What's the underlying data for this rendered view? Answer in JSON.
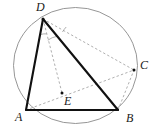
{
  "figure": {
    "canvas": {
      "width": 153,
      "height": 130,
      "background": "#ffffff"
    },
    "colors": {
      "circle_stroke": "#8a8a8a",
      "solid_stroke": "#111111",
      "dashed_stroke": "#9a9a9a",
      "label_fill": "#1a1a1a",
      "point_fill": "#111111"
    },
    "circle": {
      "name": "circumscribed-circle",
      "cx": 75.5,
      "cy": 65.5,
      "rx": 62,
      "ry": 58,
      "stroke_width": 0.9
    },
    "points": [
      {
        "id": "A",
        "label": "A",
        "x": 26,
        "y": 110,
        "label_x": 15,
        "label_y": 121,
        "dot": false
      },
      {
        "id": "B",
        "label": "B",
        "x": 118,
        "y": 110,
        "label_x": 126,
        "label_y": 122,
        "dot": false
      },
      {
        "id": "C",
        "label": "C",
        "x": 134,
        "y": 70,
        "label_x": 140,
        "label_y": 69,
        "dot": true
      },
      {
        "id": "D",
        "label": "D",
        "x": 43,
        "y": 19,
        "label_x": 36,
        "label_y": 11,
        "dot": true
      },
      {
        "id": "E",
        "label": "E",
        "x": 62,
        "y": 93,
        "label_x": 64,
        "label_y": 105,
        "dot": true
      }
    ],
    "solid_segments": [
      {
        "id": "AD",
        "name": "segment-a-d",
        "x1": 26,
        "y1": 110,
        "x2": 43,
        "y2": 19,
        "width": 2.1
      },
      {
        "id": "DB",
        "name": "segment-d-b",
        "x1": 43,
        "y1": 19,
        "x2": 118,
        "y2": 110,
        "width": 2.1
      },
      {
        "id": "AB",
        "name": "segment-a-b",
        "x1": 26,
        "y1": 110,
        "x2": 118,
        "y2": 110,
        "width": 2.1
      }
    ],
    "dashed_segments": [
      {
        "id": "DC",
        "name": "segment-d-c",
        "x1": 43,
        "y1": 19,
        "x2": 134,
        "y2": 70,
        "width": 0.8
      },
      {
        "id": "DE",
        "name": "segment-d-e",
        "x1": 43,
        "y1": 19,
        "x2": 62,
        "y2": 93,
        "width": 0.8
      },
      {
        "id": "AC",
        "name": "segment-a-c",
        "x1": 26,
        "y1": 110,
        "x2": 134,
        "y2": 70,
        "width": 0.8
      },
      {
        "id": "BC",
        "name": "segment-b-c",
        "x1": 118,
        "y1": 110,
        "x2": 134,
        "y2": 70,
        "width": 0.8
      }
    ],
    "angle_arcs": [
      {
        "id": "angle-ADE",
        "name": "angle-arc-a-d-e",
        "d": "M 40.5 34.5 A 16 16 0 0 1 46.8 33.9",
        "width": 0.8
      },
      {
        "id": "angle-EDB",
        "name": "angle-arc-e-d-b",
        "d": "M 47.8 40.2 A 23 23 0 0 1 57.0 36.3",
        "width": 0.8
      },
      {
        "id": "angle-CDB",
        "name": "angle-arc-c-d-b",
        "d": "M 62.5 32.0 A 24 24 0 0 1 66.2 27.0",
        "width": 0.8
      }
    ]
  }
}
